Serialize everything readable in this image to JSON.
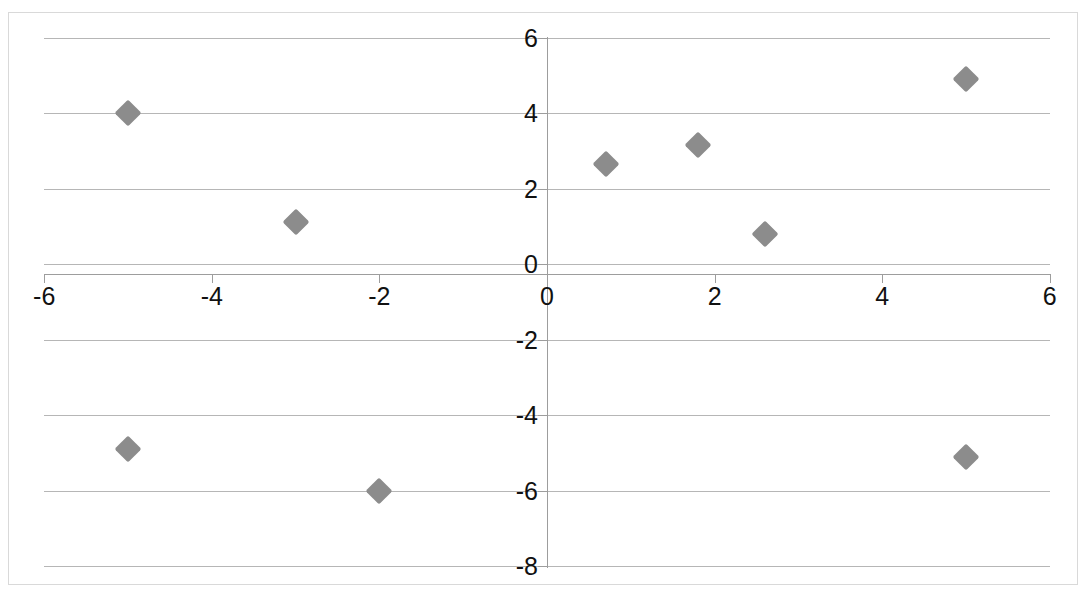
{
  "chart_data": {
    "type": "scatter",
    "title": "",
    "subtitle": "",
    "xlabel": "",
    "ylabel": "",
    "xlim": [
      -6,
      6
    ],
    "ylim": [
      -8,
      6
    ],
    "grid": true,
    "legend": "none",
    "marker_shape": "diamond",
    "marker_color": "#8c8c8c",
    "xticks": [
      "-6",
      "-4",
      "-2",
      "0",
      "2",
      "4",
      "6"
    ],
    "xtick_values": [
      -6,
      -4,
      -2,
      0,
      2,
      4,
      6
    ],
    "yticks": [
      "6",
      "4",
      "2",
      "0",
      "-2",
      "-4",
      "-6",
      "-8"
    ],
    "ytick_values": [
      6,
      4,
      2,
      0,
      -2,
      -4,
      -6,
      -8
    ],
    "series": [
      {
        "name": "Series1",
        "points": [
          {
            "x": -5,
            "y": 4
          },
          {
            "x": -3,
            "y": 1.1
          },
          {
            "x": 0.7,
            "y": 2.65
          },
          {
            "x": 1.8,
            "y": 3.15
          },
          {
            "x": 2.6,
            "y": 0.8
          },
          {
            "x": 5,
            "y": 4.9
          },
          {
            "x": -5,
            "y": -4.9
          },
          {
            "x": -2,
            "y": -6
          },
          {
            "x": 5,
            "y": -5.1
          }
        ]
      }
    ]
  }
}
